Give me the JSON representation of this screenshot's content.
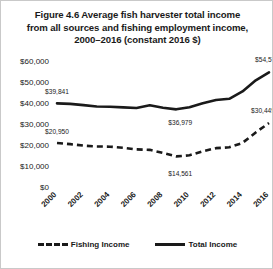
{
  "figure": {
    "title_lines": [
      "Figure 4.6 Average fish harvester total income",
      "from all sources and fishing employment income,",
      "2000–2016 (constant 2016 $)"
    ]
  },
  "legend": {
    "items": [
      {
        "label": "Fishing Income",
        "style": "dashed"
      },
      {
        "label": "Total Income",
        "style": "solid"
      }
    ]
  },
  "chart_data": {
    "type": "line",
    "title": "Figure 4.6 Average fish harvester total income from all sources and fishing employment income, 2000–2016 (constant 2016 $)",
    "xlabel": "",
    "ylabel": "",
    "grid": false,
    "legend_position": "bottom",
    "x": [
      2000,
      2001,
      2002,
      2003,
      2004,
      2005,
      2006,
      2007,
      2008,
      2009,
      2010,
      2011,
      2012,
      2013,
      2014,
      2015,
      2016
    ],
    "xticklabels": [
      "2000",
      "2002",
      "2004",
      "2006",
      "2008",
      "2010",
      "2012",
      "2014",
      "2016"
    ],
    "xtickvalues": [
      2000,
      2002,
      2004,
      2006,
      2008,
      2010,
      2012,
      2014,
      2016
    ],
    "ylim": [
      0,
      60000
    ],
    "yticks": [
      0,
      10000,
      20000,
      30000,
      40000,
      50000,
      60000
    ],
    "yticklabels": [
      "$0",
      "$10,000",
      "$20,000",
      "$30,000",
      "$40,000",
      "$50,000",
      "$60,000"
    ],
    "series": [
      {
        "name": "Total Income",
        "style": "solid",
        "values": [
          39841,
          39600,
          39000,
          38300,
          38250,
          37900,
          37600,
          38900,
          37700,
          36979,
          38000,
          39900,
          41400,
          42000,
          45500,
          50800,
          54572
        ]
      },
      {
        "name": "Fishing Income",
        "style": "dashed",
        "values": [
          20950,
          20400,
          19700,
          19300,
          19200,
          18700,
          17900,
          17700,
          16200,
          14561,
          15100,
          17000,
          18500,
          18900,
          21000,
          26000,
          30449
        ]
      }
    ],
    "annotations": [
      {
        "text": "$39,841",
        "series": "Total Income",
        "x": 2000,
        "y": 39841
      },
      {
        "text": "$36,979",
        "series": "Total Income",
        "x": 2009,
        "y": 36979
      },
      {
        "text": "$54,572",
        "series": "Total Income",
        "x": 2016,
        "y": 54572
      },
      {
        "text": "$20,950",
        "series": "Fishing Income",
        "x": 2000,
        "y": 20950
      },
      {
        "text": "$14,561",
        "series": "Fishing Income",
        "x": 2009,
        "y": 14561
      },
      {
        "text": "$30,449",
        "series": "Fishing Income",
        "x": 2016,
        "y": 30449
      }
    ]
  }
}
